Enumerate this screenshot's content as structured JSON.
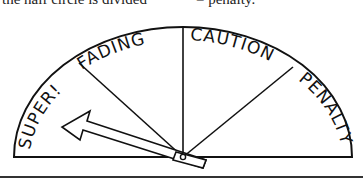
{
  "caption": {
    "left_fragment": "the half circle is divided",
    "right_fragment": "= penalty."
  },
  "gauge": {
    "segments": [
      {
        "label": "SUPER!"
      },
      {
        "label": "FADING"
      },
      {
        "label": "CAUTION"
      },
      {
        "label": "PENALTY"
      }
    ],
    "needle_pointing_to": "SUPER!",
    "stroke_color": "#111111",
    "background_color": "#ffffff"
  }
}
